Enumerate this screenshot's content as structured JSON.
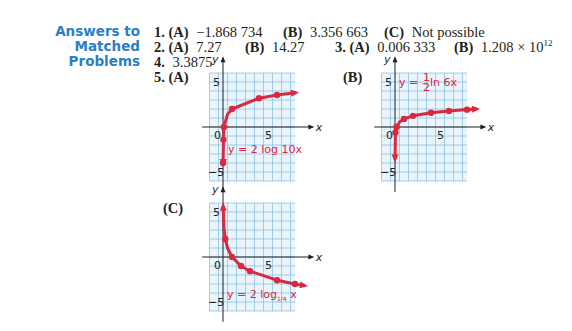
{
  "section": {
    "heading_line1": "Answers to",
    "heading_line2": "Matched Problems"
  },
  "answers": {
    "p1": {
      "num": "1.",
      "a_label": "(A)",
      "a_value": "−1.868 734",
      "b_label": "(B)",
      "b_value": "3.356 663",
      "c_label": "(C)",
      "c_value": "Not possible"
    },
    "p2": {
      "num": "2.",
      "a_label": "(A)",
      "a_value": "7.27",
      "b_label": "(B)",
      "b_value": "14.27"
    },
    "p3": {
      "num": "3.",
      "a_label": "(A)",
      "a_value": "0.006 333",
      "b_label": "(B)",
      "b_value_base": "1.208 × 10",
      "b_value_exp": "12"
    },
    "p4": {
      "num": "4.",
      "value": "3.3875"
    },
    "p5": {
      "num": "5.",
      "a_label": "(A)",
      "b_label": "(B)",
      "c_label": "(C)"
    }
  },
  "colors": {
    "heading": "#2a7fc4",
    "grid_line": "#8ec3e6",
    "grid_bg": "#eaf4fb",
    "curve": "#d9283f",
    "axis": "#231f20"
  },
  "chart_data": [
    {
      "id": "A",
      "type": "line",
      "title": "(A)",
      "equation": "y = 2 log 10x",
      "xlabel": "x",
      "ylabel": "y",
      "xlim": [
        -1,
        8
      ],
      "ylim": [
        -5.5,
        6
      ],
      "ticks": {
        "x": [
          "0",
          "5"
        ],
        "y": [
          "5",
          "−5"
        ]
      },
      "grid": true,
      "points": [
        {
          "x": 0.01,
          "y": -4
        },
        {
          "x": 0.05,
          "y": -1.4
        },
        {
          "x": 0.1,
          "y": 0
        },
        {
          "x": 0.5,
          "y": 1.4
        },
        {
          "x": 1,
          "y": 2
        },
        {
          "x": 4,
          "y": 3.2
        },
        {
          "x": 6,
          "y": 3.56
        },
        {
          "x": 8,
          "y": 3.8
        }
      ],
      "markers": [
        {
          "x": 0.01,
          "y": -4
        },
        {
          "x": 0.05,
          "y": -1.4
        },
        {
          "x": 0.1,
          "y": 0
        },
        {
          "x": 1,
          "y": 2
        },
        {
          "x": 4,
          "y": 3.2
        },
        {
          "x": 6,
          "y": 3.56
        }
      ]
    },
    {
      "id": "B",
      "type": "line",
      "title": "(B)",
      "equation": "y = ½ ln 6x",
      "equation_parts": {
        "lhs": "y = ",
        "num": "1",
        "den": "2",
        "rhs": " ln 6x"
      },
      "xlabel": "x",
      "ylabel": "y",
      "xlim": [
        -1,
        8
      ],
      "ylim": [
        -5.5,
        6
      ],
      "ticks": {
        "x": [
          "0",
          "5"
        ],
        "y": [
          "5",
          "−5"
        ]
      },
      "grid": true,
      "points": [
        {
          "x": 0.001,
          "y": -3.5
        },
        {
          "x": 0.05,
          "y": -0.6
        },
        {
          "x": 0.17,
          "y": 0
        },
        {
          "x": 0.5,
          "y": 0.55
        },
        {
          "x": 1,
          "y": 0.9
        },
        {
          "x": 2,
          "y": 1.24
        },
        {
          "x": 4,
          "y": 1.59
        },
        {
          "x": 6,
          "y": 1.79
        },
        {
          "x": 8,
          "y": 1.93
        },
        {
          "x": 9,
          "y": 2.0
        }
      ],
      "markers": [
        {
          "x": 0.05,
          "y": -0.6
        },
        {
          "x": 0.17,
          "y": 0
        },
        {
          "x": 1,
          "y": 0.9
        },
        {
          "x": 2,
          "y": 1.24
        },
        {
          "x": 4,
          "y": 1.59
        },
        {
          "x": 6,
          "y": 1.79
        },
        {
          "x": 8,
          "y": 1.93
        }
      ]
    },
    {
      "id": "C",
      "type": "line",
      "title": "(C)",
      "equation": "y = 2 log1/4 x",
      "equation_parts": {
        "lhs": "y = 2 log",
        "sub": "1/4",
        "rhs": " x"
      },
      "xlabel": "x",
      "ylabel": "y",
      "xlim": [
        -1,
        8
      ],
      "ylim": [
        -5.5,
        6
      ],
      "ticks": {
        "x": [
          "0",
          "5"
        ],
        "y": [
          "5",
          "−5"
        ]
      },
      "grid": true,
      "points": [
        {
          "x": 0.02,
          "y": 5.6
        },
        {
          "x": 0.1,
          "y": 3.3
        },
        {
          "x": 0.25,
          "y": 2
        },
        {
          "x": 0.5,
          "y": 1
        },
        {
          "x": 1,
          "y": 0
        },
        {
          "x": 2,
          "y": -1
        },
        {
          "x": 3,
          "y": -1.58
        },
        {
          "x": 6,
          "y": -2.58
        },
        {
          "x": 8,
          "y": -3
        },
        {
          "x": 9,
          "y": -3.17
        }
      ],
      "markers": [
        {
          "x": 0.25,
          "y": 2
        },
        {
          "x": 1,
          "y": 0
        },
        {
          "x": 2,
          "y": -1
        },
        {
          "x": 3,
          "y": -1.58
        },
        {
          "x": 6,
          "y": -2.58
        },
        {
          "x": 8,
          "y": -3
        }
      ]
    }
  ]
}
